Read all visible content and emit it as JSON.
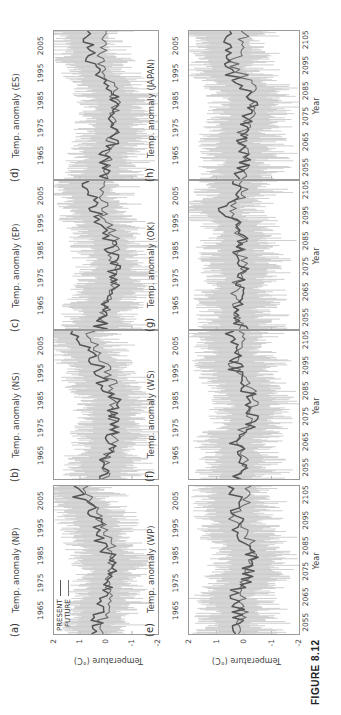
{
  "figure": {
    "caption": "FIGURE 8.12",
    "legend": {
      "present": "PRESENT",
      "future": "FUTURE"
    },
    "ylabel": "Temperature (°C)",
    "xlabel": "Year",
    "colors": {
      "present_line": "#555555",
      "future_line": "#6e6e6e",
      "spread": "#c8c8c8",
      "frame": "#9a9a9a"
    }
  },
  "panels": [
    {
      "tag": "(a)",
      "title": "Temp. anomaly (NP)"
    },
    {
      "tag": "(b)",
      "title": "Temp. anomaly (NS)"
    },
    {
      "tag": "(c)",
      "title": "Temp. anomaly (EP)"
    },
    {
      "tag": "(d)",
      "title": "Temp. anomaly (ES)"
    },
    {
      "tag": "(e)",
      "title": "Temp. anomaly (WP)"
    },
    {
      "tag": "(f)",
      "title": "Temp. anomaly (WS)"
    },
    {
      "tag": "(g)",
      "title": "Temp. anomaly (OK)"
    },
    {
      "tag": "(h)",
      "title": "Temp. anomaly (JAPAN)"
    }
  ],
  "axes": {
    "top_ticks": [
      "1965",
      "1975",
      "1985",
      "1995",
      "2005"
    ],
    "bottom_ticks": [
      "2055",
      "2065",
      "2075",
      "2085",
      "2095",
      "2105"
    ],
    "y_ticks": [
      "2",
      "1",
      "0",
      "-1",
      "-2"
    ]
  },
  "chart_data": {
    "type": "line",
    "title": "FIGURE 8.12",
    "layout": "2 rows x 4 columns of small multiples (figure rotated 90° counter-clockwise on page)",
    "xlabel": "Year",
    "ylabel": "Temperature (°C)",
    "ylim": [
      -2,
      2
    ],
    "x_present_range": [
      1956,
      2010
    ],
    "x_future_range": [
      2046,
      2110
    ],
    "x_top_ticks": [
      1965,
      1975,
      1985,
      1995,
      2005
    ],
    "x_bottom_ticks": [
      2055,
      2065,
      2075,
      2085,
      2095,
      2105
    ],
    "y_ticks": [
      2,
      1,
      0,
      -1,
      -2
    ],
    "legend": [
      "PRESENT",
      "FUTURE"
    ],
    "legend_position": "upper left of panel (a)",
    "grid": false,
    "shaded_band": "light gray ensemble spread around annual series (approx. ±1–1.5 °C)",
    "panels": [
      {
        "id": "a",
        "region": "NP",
        "title": "Temp. anomaly (NP)",
        "present_approx": {
          "x": [
            1958,
            1965,
            1970,
            1975,
            1980,
            1985,
            1990,
            1995,
            2000,
            2005,
            2008
          ],
          "y": [
            0.4,
            0.2,
            0.0,
            -0.1,
            -0.2,
            -0.1,
            0.2,
            0.3,
            0.5,
            0.9,
            1.2
          ]
        },
        "future_approx": {
          "x": [
            2048,
            2055,
            2065,
            2075,
            2085,
            2095,
            2105,
            2108
          ],
          "y": [
            0.3,
            0.1,
            -0.1,
            -0.2,
            -0.2,
            0.3,
            0.8,
            0.9
          ]
        }
      },
      {
        "id": "b",
        "region": "NS",
        "title": "Temp. anomaly (NS)",
        "present_approx": {
          "x": [
            1958,
            1965,
            1970,
            1975,
            1980,
            1985,
            1990,
            1995,
            2000,
            2005,
            2008
          ],
          "y": [
            0.1,
            0.0,
            -0.2,
            -0.2,
            -0.3,
            -0.3,
            0.1,
            0.2,
            0.5,
            0.8,
            1.2
          ]
        },
        "future_approx": {
          "x": [
            2048,
            2055,
            2065,
            2075,
            2085,
            2095,
            2105,
            2108
          ],
          "y": [
            0.1,
            0.0,
            -0.3,
            -0.3,
            -0.3,
            0.1,
            0.5,
            0.6
          ]
        }
      },
      {
        "id": "c",
        "region": "EP",
        "title": "Temp. anomaly (EP)",
        "present_approx": {
          "x": [
            1958,
            1965,
            1970,
            1975,
            1980,
            1985,
            1990,
            1995,
            2000,
            2005,
            2008
          ],
          "y": [
            0.2,
            0.1,
            -0.2,
            -0.3,
            -0.3,
            -0.2,
            -0.1,
            0.2,
            0.4,
            0.6,
            0.7
          ]
        },
        "future_approx": {
          "x": [
            2048,
            2055,
            2065,
            2075,
            2085,
            2095,
            2105,
            2108
          ],
          "y": [
            0.2,
            0.0,
            -0.2,
            -0.3,
            -0.3,
            0.1,
            0.1,
            0.1
          ]
        }
      },
      {
        "id": "d",
        "region": "ES",
        "title": "Temp. anomaly (ES)",
        "present_approx": {
          "x": [
            1958,
            1965,
            1970,
            1975,
            1980,
            1985,
            1990,
            1995,
            2000,
            2005,
            2008
          ],
          "y": [
            0.1,
            0.0,
            -0.3,
            -0.3,
            -0.4,
            -0.4,
            -0.1,
            0.3,
            0.6,
            0.7,
            0.8
          ]
        },
        "future_approx": {
          "x": [
            2048,
            2055,
            2065,
            2075,
            2085,
            2095,
            2105,
            2108
          ],
          "y": [
            0.1,
            0.0,
            -0.2,
            -0.3,
            -0.4,
            0.3,
            0.0,
            0.0
          ]
        }
      },
      {
        "id": "e",
        "region": "WP",
        "title": "Temp. anomaly (WP)",
        "present_approx": {
          "x": [
            1958,
            1965,
            1970,
            1975,
            1980,
            1985,
            1990,
            1995,
            2000,
            2005,
            2008
          ],
          "y": [
            0.3,
            0.2,
            0.5,
            -0.1,
            -0.2,
            -0.3,
            0.0,
            0.2,
            0.3,
            0.3,
            0.4
          ]
        },
        "future_approx": {
          "x": [
            2048,
            2055,
            2065,
            2075,
            2085,
            2095,
            2105,
            2108
          ],
          "y": [
            0.2,
            0.0,
            0.1,
            -0.2,
            -0.3,
            0.4,
            -0.3,
            -0.2
          ]
        }
      },
      {
        "id": "f",
        "region": "WS",
        "title": "Temp. anomaly (WS)",
        "present_approx": {
          "x": [
            1958,
            1965,
            1970,
            1975,
            1980,
            1985,
            1990,
            1995,
            2000,
            2005,
            2008
          ],
          "y": [
            0.2,
            0.1,
            0.4,
            -0.2,
            -0.3,
            -0.3,
            0.0,
            0.3,
            0.3,
            0.4,
            0.5
          ]
        },
        "future_approx": {
          "x": [
            2048,
            2055,
            2065,
            2075,
            2085,
            2095,
            2105,
            2108
          ],
          "y": [
            0.2,
            0.0,
            0.2,
            -0.3,
            -0.3,
            0.4,
            0.0,
            0.0
          ]
        }
      },
      {
        "id": "g",
        "region": "OK",
        "title": "Temp. anomaly (OK)",
        "present_approx": {
          "x": [
            1958,
            1965,
            1970,
            1975,
            1980,
            1985,
            1990,
            1995,
            2000,
            2005,
            2008
          ],
          "y": [
            0.1,
            0.2,
            0.3,
            0.0,
            0.1,
            0.2,
            0.0,
            0.3,
            1.0,
            0.2,
            0.3
          ]
        },
        "future_approx": {
          "x": [
            2048,
            2055,
            2065,
            2075,
            2085,
            2095,
            2105,
            2108
          ],
          "y": [
            0.0,
            0.2,
            0.3,
            0.0,
            0.1,
            0.4,
            0.0,
            0.0
          ]
        }
      },
      {
        "id": "h",
        "region": "JAPAN",
        "title": "Temp. anomaly (JAPAN)",
        "present_approx": {
          "x": [
            1958,
            1965,
            1970,
            1975,
            1980,
            1985,
            1990,
            1995,
            2000,
            2005,
            2008
          ],
          "y": [
            0.1,
            0.0,
            0.2,
            -0.1,
            -0.2,
            -0.3,
            0.0,
            0.6,
            0.4,
            0.6,
            0.6
          ]
        },
        "future_approx": {
          "x": [
            2048,
            2055,
            2065,
            2075,
            2085,
            2095,
            2105,
            2108
          ],
          "y": [
            0.1,
            0.0,
            0.1,
            -0.2,
            -0.3,
            0.4,
            0.0,
            0.0
          ]
        }
      }
    ]
  }
}
